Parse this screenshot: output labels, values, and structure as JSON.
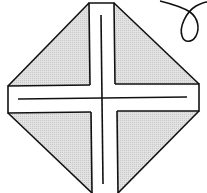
{
  "diagram": {
    "type": "origami-fold-diagram",
    "colors": {
      "stroke": "#111111",
      "shade": "#d8d8d8",
      "paper": "#ffffff"
    },
    "elements": {
      "quadrants": [
        "top-left-flap",
        "top-right-flap",
        "bottom-left-flap",
        "bottom-right-flap"
      ],
      "strips": [
        "vertical-strip",
        "horizontal-strip"
      ],
      "fold_lines": [
        "vertical-center-line",
        "horizontal-center-line"
      ],
      "symbols": [
        "turn-over-loop-arrow"
      ]
    }
  }
}
